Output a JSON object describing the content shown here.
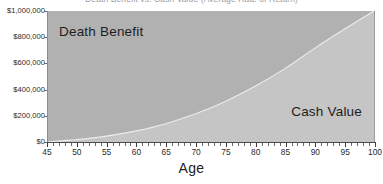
{
  "chart_data": {
    "type": "area",
    "title": "Death Benefit vs. Cash Value (Average Rate of Return)",
    "xlabel": "Age",
    "ylabel": "",
    "xlim": [
      45,
      100
    ],
    "ylim": [
      0,
      1000000
    ],
    "grid": false,
    "legend_position": "inline-labels",
    "x_tick_labels": [
      "45",
      "50",
      "55",
      "60",
      "65",
      "70",
      "75",
      "80",
      "85",
      "90",
      "95",
      "100"
    ],
    "x_tick_values": [
      45,
      50,
      55,
      60,
      65,
      70,
      75,
      80,
      85,
      90,
      95,
      100
    ],
    "y_tick_labels": [
      "$0",
      "$200,000",
      "$400,000",
      "$600,000",
      "$800,000",
      "$1,000,000"
    ],
    "y_tick_values": [
      0,
      200000,
      400000,
      600000,
      800000,
      1000000
    ],
    "series": [
      {
        "name": "Cash Value",
        "color": "#c5c5c5",
        "x": [
          45,
          50,
          55,
          60,
          65,
          70,
          75,
          80,
          85,
          90,
          95,
          100
        ],
        "values": [
          0,
          18000,
          45000,
          85000,
          140000,
          215000,
          310000,
          425000,
          560000,
          715000,
          860000,
          1000000
        ]
      },
      {
        "name": "Death Benefit",
        "color": "#b1b1b1",
        "x": [
          45,
          50,
          55,
          60,
          65,
          70,
          75,
          80,
          85,
          90,
          95,
          100
        ],
        "values": [
          1000000,
          1000000,
          1000000,
          1000000,
          1000000,
          1000000,
          1000000,
          1000000,
          1000000,
          1000000,
          1000000,
          1000000
        ]
      }
    ],
    "annotations": [
      {
        "text": "Death Benefit",
        "region": "upper-left"
      },
      {
        "text": "Cash Value",
        "region": "lower-right"
      }
    ]
  },
  "colors": {
    "death_benefit_fill": "#b1b1b1",
    "cash_value_fill": "#c5c5c5",
    "divider_line": "#e8e8e8",
    "axis": "#4a4a4a",
    "text": "#232323",
    "background": "#ffffff"
  }
}
